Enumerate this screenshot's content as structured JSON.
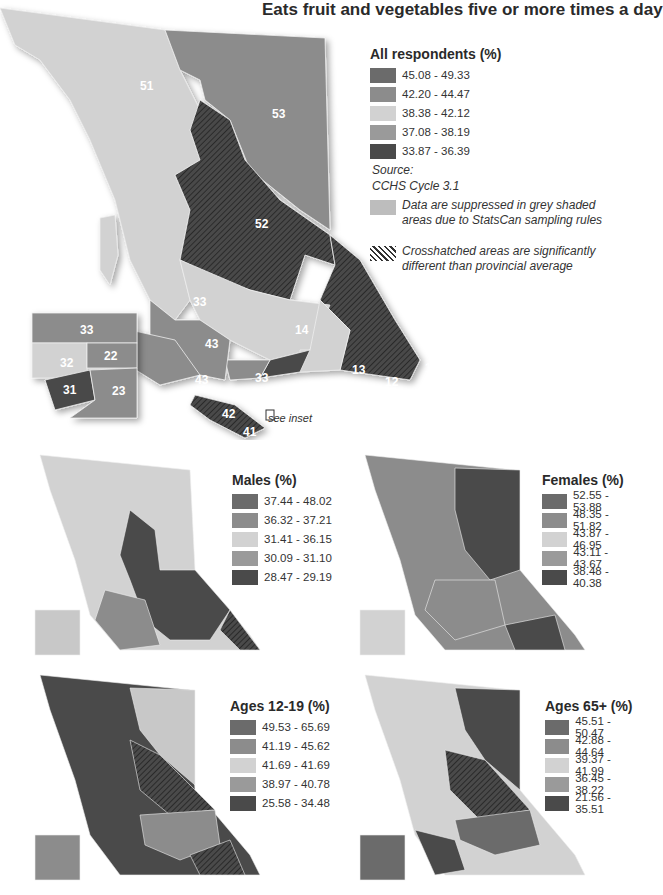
{
  "title": "Eats fruit and vegetables five or more times a day",
  "colors": {
    "class1": "#6b6b6b",
    "class2": "#8c8c8c",
    "class3": "#d2d2d2",
    "class4": "#9a9a9a",
    "class5": "#4a4a4a",
    "suppressed": "#bdbdbd"
  },
  "main_map": {
    "legend_title": "All respondents (%)",
    "legend": [
      "45.08 - 49.33",
      "42.20 - 44.47",
      "38.38 - 42.12",
      "37.08 - 38.19",
      "33.87 - 36.39"
    ],
    "source_label": "Source:",
    "source_value": "CCHS Cycle 3.1",
    "suppressed_note": "Data are suppressed in grey shaded areas due to StatsCan sampling rules",
    "crosshatch_note": "Crosshatched areas are significantly different than provincial average",
    "see_inset": "see inset",
    "region_labels": [
      "51",
      "53",
      "52",
      "33",
      "14",
      "43",
      "43",
      "33",
      "13",
      "12",
      "11",
      "21",
      "42",
      "41"
    ],
    "inset_labels": [
      "33",
      "32",
      "22",
      "31",
      "23"
    ]
  },
  "small_maps": [
    {
      "legend_title": "Males (%)",
      "legend": [
        "37.44 - 48.02",
        "36.32 - 37.21",
        "31.41 - 36.15",
        "30.09 - 31.10",
        "28.47 - 29.19"
      ]
    },
    {
      "legend_title": "Females (%)",
      "legend": [
        "52.55 - 53.88",
        "48.35 - 51.82",
        "43.87 - 46.95",
        "43.11 - 43.67",
        "38.48 - 40.38"
      ]
    },
    {
      "legend_title": "Ages 12-19 (%)",
      "legend": [
        "49.53 - 65.69",
        "41.19 - 45.62",
        "41.69 - 41.69",
        "38.97 - 40.78",
        "25.58 - 34.48"
      ]
    },
    {
      "legend_title": "Ages 65+ (%)",
      "legend": [
        "45.51 - 50.47",
        "42.88 - 44.64",
        "39.37 - 41.99",
        "36.45 - 38.22",
        "21.56 - 35.51"
      ]
    }
  ]
}
